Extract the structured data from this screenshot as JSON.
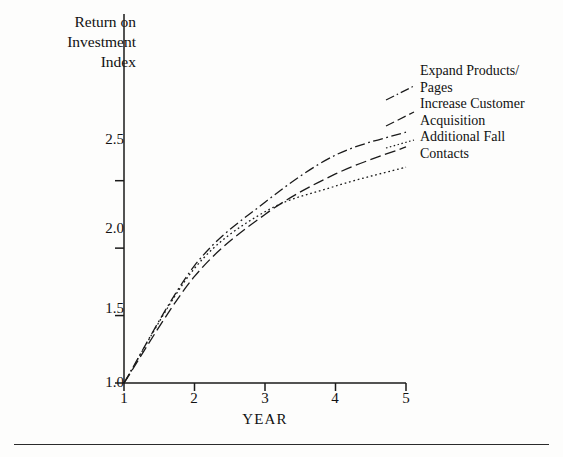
{
  "figure": {
    "y_axis_title": "Return on\nInvestment\nIndex",
    "x_axis_label": "YEAR"
  },
  "legend": [
    {
      "label": "Expand Products/\nPages",
      "style": "dash-dot",
      "color": "#1a1a1a"
    },
    {
      "label": "Increase Customer\nAcquisition",
      "style": "long-dash",
      "color": "#1a1a1a"
    },
    {
      "label": "Additional Fall\nContacts",
      "style": "dotted",
      "color": "#1a1a1a"
    }
  ],
  "ticks": {
    "y": [
      "2.5",
      "2.0",
      "1.5",
      "1.0"
    ],
    "x": [
      "1",
      "2",
      "3",
      "4",
      "5"
    ]
  },
  "chart_data": {
    "type": "line",
    "title": "",
    "xlabel": "YEAR",
    "ylabel": "Return on Investment Index",
    "x": [
      1,
      2,
      3,
      4,
      5
    ],
    "xlim": [
      1,
      5
    ],
    "ylim": [
      1.0,
      2.95
    ],
    "yticks": [
      1.0,
      1.5,
      2.0,
      2.5
    ],
    "xticks": [
      1,
      2,
      3,
      4,
      5
    ],
    "grid": false,
    "legend_position": "right",
    "series": [
      {
        "name": "Expand Products/Pages",
        "style": "dash-dot",
        "values": [
          1.0,
          1.87,
          2.34,
          2.69,
          2.86
        ]
      },
      {
        "name": "Increase Customer Acquisition",
        "style": "long-dash",
        "values": [
          1.0,
          1.79,
          2.25,
          2.55,
          2.75
        ]
      },
      {
        "name": "Additional Fall Contacts",
        "style": "dotted",
        "values": [
          1.0,
          1.85,
          2.27,
          2.46,
          2.6
        ]
      }
    ]
  }
}
